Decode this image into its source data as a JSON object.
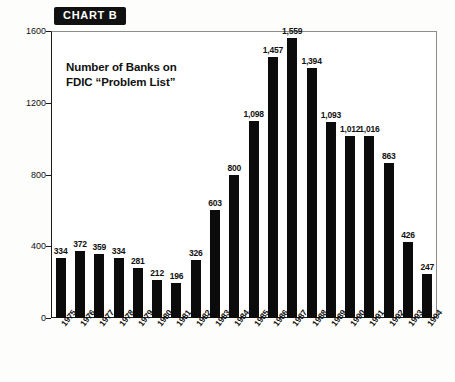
{
  "badge": {
    "label": "CHART B"
  },
  "chart_data": {
    "type": "bar",
    "title": "Number of Banks on\nFDIC “Problem List”",
    "subtitle": "",
    "xlabel": "",
    "ylabel": "",
    "ylim": [
      0,
      1600
    ],
    "yticks": [
      0,
      400,
      800,
      1200,
      1600
    ],
    "ytick_labels": [
      "0",
      "400",
      "800",
      "1200",
      "1600"
    ],
    "grid": false,
    "legend": null,
    "bar_color": "#0b0b0b",
    "categories": [
      "1975",
      "1976",
      "1977",
      "1978",
      "1979",
      "1980",
      "1981",
      "1982",
      "1983",
      "1984",
      "1985",
      "1986",
      "1987",
      "1988",
      "1989",
      "1990",
      "1991",
      "1992",
      "1993",
      "1994"
    ],
    "values": [
      334,
      372,
      359,
      334,
      281,
      212,
      196,
      326,
      603,
      800,
      1098,
      1457,
      1559,
      1394,
      1093,
      1012,
      1016,
      863,
      426,
      247
    ],
    "value_labels": [
      "334",
      "372",
      "359",
      "334",
      "281",
      "212",
      "196",
      "326",
      "603",
      "800",
      "1,098",
      "1,457",
      "1,559",
      "1,394",
      "1,093",
      "1,012",
      "1,016",
      "863",
      "426",
      "247"
    ]
  }
}
